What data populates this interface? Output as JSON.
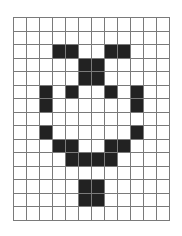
{
  "grid": {
    "columns": 12,
    "rows": 15,
    "filled_color": "#222222",
    "empty_color": "#ffffff",
    "line_color": "#7a7a7a",
    "cells": [
      [
        0,
        0,
        0,
        0,
        0,
        0,
        0,
        0,
        0,
        0,
        0,
        0
      ],
      [
        0,
        0,
        0,
        0,
        0,
        0,
        0,
        0,
        0,
        0,
        0,
        0
      ],
      [
        0,
        0,
        0,
        1,
        1,
        0,
        0,
        1,
        1,
        0,
        0,
        0
      ],
      [
        0,
        0,
        0,
        0,
        0,
        1,
        1,
        0,
        0,
        0,
        0,
        0
      ],
      [
        0,
        0,
        0,
        0,
        0,
        1,
        1,
        0,
        0,
        0,
        0,
        0
      ],
      [
        0,
        0,
        1,
        0,
        1,
        0,
        0,
        1,
        0,
        1,
        0,
        0
      ],
      [
        0,
        0,
        1,
        0,
        0,
        0,
        0,
        0,
        0,
        1,
        0,
        0
      ],
      [
        0,
        0,
        0,
        0,
        0,
        0,
        0,
        0,
        0,
        0,
        0,
        0
      ],
      [
        0,
        0,
        1,
        0,
        0,
        0,
        0,
        0,
        0,
        1,
        0,
        0
      ],
      [
        0,
        0,
        0,
        1,
        1,
        0,
        0,
        1,
        1,
        0,
        0,
        0
      ],
      [
        0,
        0,
        0,
        0,
        1,
        1,
        1,
        1,
        0,
        0,
        0,
        0
      ],
      [
        0,
        0,
        0,
        0,
        0,
        0,
        0,
        0,
        0,
        0,
        0,
        0
      ],
      [
        0,
        0,
        0,
        0,
        0,
        1,
        1,
        0,
        0,
        0,
        0,
        0
      ],
      [
        0,
        0,
        0,
        0,
        0,
        1,
        1,
        0,
        0,
        0,
        0,
        0
      ],
      [
        0,
        0,
        0,
        0,
        0,
        0,
        0,
        0,
        0,
        0,
        0,
        0
      ]
    ]
  }
}
